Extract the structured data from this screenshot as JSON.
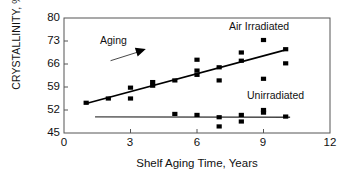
{
  "chart_data": {
    "type": "scatter",
    "title": "",
    "xlabel": "Shelf Aging Time, Years",
    "ylabel": "CRYSTALLINITY, %",
    "xlim": [
      0,
      12
    ],
    "ylim": [
      45,
      80
    ],
    "xticks": [
      0,
      3,
      6,
      9,
      12
    ],
    "yticks": [
      45,
      52,
      59,
      66,
      73,
      80
    ],
    "grid": false,
    "legend_position": "inline-annotations",
    "annotations": [
      {
        "name": "aging-arrow-label",
        "text": "Aging",
        "x": 1.6,
        "y": 71.5
      },
      {
        "name": "air-irradiated-label",
        "text": "Air Irradiated",
        "x": 7.4,
        "y": 76.5
      },
      {
        "name": "unirradiated-label",
        "text": "Unirradiated",
        "x": 8.3,
        "y": 56.0
      }
    ],
    "arrow": {
      "name": "aging-arrow",
      "x1": 2.1,
      "y1": 67.0,
      "x2": 3.6,
      "y2": 70.2
    },
    "series": [
      {
        "name": "Air Irradiated",
        "marker": "square",
        "color": "#000000",
        "points": [
          [
            1,
            54.2
          ],
          [
            2,
            55.5
          ],
          [
            3,
            58.8
          ],
          [
            3,
            55.5
          ],
          [
            4,
            60.5
          ],
          [
            4,
            59.4
          ],
          [
            5,
            61.0
          ],
          [
            6,
            67.3
          ],
          [
            6,
            64.0
          ],
          [
            6,
            62.7
          ],
          [
            7,
            65.0
          ],
          [
            7,
            61.0
          ],
          [
            8,
            69.5
          ],
          [
            8,
            67.0
          ],
          [
            9,
            73.3
          ],
          [
            9,
            61.5
          ],
          [
            10,
            70.5
          ],
          [
            10,
            66.2
          ]
        ],
        "trendline": {
          "x1": 1,
          "y1": 54.0,
          "x2": 10,
          "y2": 70.3
        }
      },
      {
        "name": "Unirradiated",
        "marker": "square",
        "color": "#000000",
        "points": [
          [
            5,
            50.8
          ],
          [
            6,
            50.5
          ],
          [
            7,
            49.8
          ],
          [
            7,
            47.0
          ],
          [
            8,
            50.5
          ],
          [
            8,
            48.5
          ],
          [
            9,
            52.0
          ],
          [
            9,
            51.2
          ],
          [
            10,
            50.0
          ]
        ],
        "trendline": {
          "x1": 1.4,
          "y1": 49.9,
          "x2": 10.2,
          "y2": 49.8
        }
      }
    ]
  },
  "axes": {
    "y_tick_labels": [
      "80",
      "73",
      "66",
      "59",
      "52",
      "45"
    ],
    "x_tick_labels": [
      "0",
      "3",
      "6",
      "9",
      "12"
    ],
    "y_axis_title": "CRYSTALLINITY, %",
    "x_axis_title": "Shelf Aging Time, Years"
  },
  "labels": {
    "aging": "Aging",
    "air_irradiated": "Air Irradiated",
    "unirradiated": "Unirradiated"
  },
  "colors": {
    "marker": "#000000",
    "trendline": "#000000",
    "frame": "#555555",
    "background": "#ffffff",
    "text": "#111111"
  }
}
